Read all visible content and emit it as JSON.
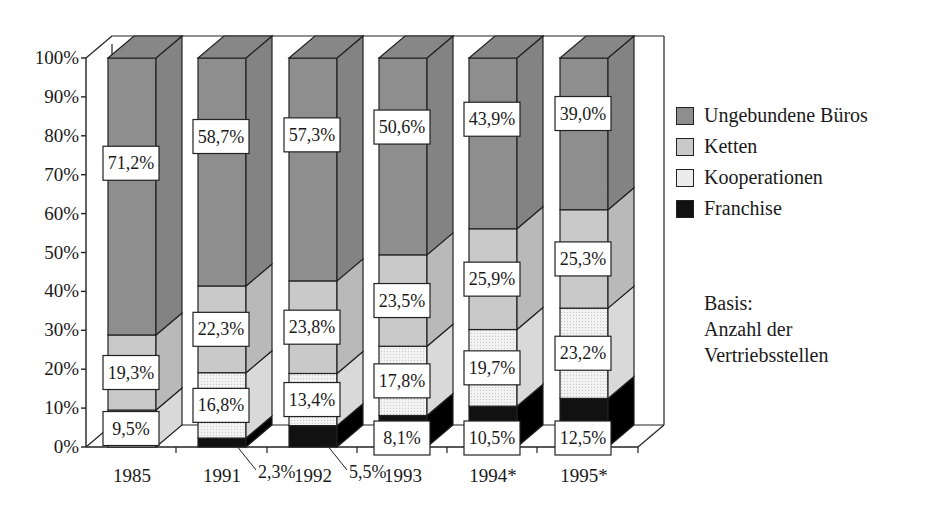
{
  "chart_data": {
    "type": "bar",
    "subtype": "stacked-100-percent-3d",
    "title": "",
    "xlabel": "",
    "ylabel": "",
    "ylim": [
      0,
      100
    ],
    "y_ticks": [
      "0%",
      "10%",
      "20%",
      "30%",
      "40%",
      "50%",
      "60%",
      "70%",
      "80%",
      "90%",
      "100%"
    ],
    "categories": [
      "1985",
      "1991",
      "1992",
      "1993",
      "1994*",
      "1995*"
    ],
    "series": [
      {
        "name": "Franchise",
        "color": "#111111",
        "values": [
          0,
          2.3,
          5.5,
          8.1,
          10.5,
          12.5
        ],
        "labels": [
          "",
          "2,3%",
          "5,5%",
          "8,1%",
          "10,5%",
          "12,5%"
        ]
      },
      {
        "name": "Kooperationen",
        "color": "#ececec",
        "values": [
          9.5,
          16.8,
          13.4,
          17.8,
          19.7,
          23.2
        ],
        "labels": [
          "9,5%",
          "16,8%",
          "13,4%",
          "17,8%",
          "19,7%",
          "23,2%"
        ]
      },
      {
        "name": "Ketten",
        "color": "#c9c9c9",
        "values": [
          19.3,
          22.3,
          23.8,
          23.5,
          25.9,
          25.3
        ],
        "labels": [
          "19,3%",
          "22,3%",
          "23,8%",
          "23,5%",
          "25,9%",
          "25,3%"
        ]
      },
      {
        "name": "Ungebundene Büros",
        "color": "#8e8e8e",
        "values": [
          71.2,
          58.7,
          57.3,
          50.6,
          43.9,
          39.0
        ],
        "labels": [
          "71,2%",
          "58,7%",
          "57,3%",
          "50,6%",
          "43,9%",
          "39,0%"
        ]
      }
    ],
    "legend_position": "right",
    "grid": false,
    "annotations": [
      "Basis:",
      "Anzahl der",
      "Vertriebsstellen"
    ]
  },
  "legend": {
    "items": [
      {
        "label": "Ungebundene Büros",
        "color": "#8e8e8e"
      },
      {
        "label": "Ketten",
        "color": "#c9c9c9"
      },
      {
        "label": "Kooperationen",
        "color": "#ececec"
      },
      {
        "label": "Franchise",
        "color": "#111111"
      }
    ]
  },
  "note": {
    "line1": "Basis:",
    "line2": "Anzahl der",
    "line3": "Vertriebsstellen"
  }
}
